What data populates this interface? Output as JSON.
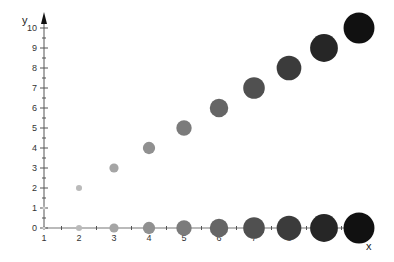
{
  "chart_data": {
    "type": "scatter",
    "title": "",
    "xlabel": "x",
    "ylabel": "y",
    "xlim": [
      1,
      10
    ],
    "ylim": [
      0,
      10
    ],
    "x_ticks": [
      "1",
      "2",
      "3",
      "4",
      "5",
      "6",
      "7",
      "8",
      "9",
      "10"
    ],
    "x_tick_labels_visible": [
      "1",
      "2",
      "3",
      "4",
      "5",
      "6",
      "7",
      "8",
      "9"
    ],
    "y_ticks": [
      "0",
      "1",
      "2",
      "3",
      "4",
      "5",
      "6",
      "7",
      "8",
      "9",
      "10"
    ],
    "grid": false,
    "legend": null,
    "series": [
      {
        "name": "diagonal",
        "points": [
          {
            "x": 1,
            "y": 1,
            "size": 1
          },
          {
            "x": 2,
            "y": 2,
            "size": 2
          },
          {
            "x": 3,
            "y": 3,
            "size": 3
          },
          {
            "x": 4,
            "y": 4,
            "size": 4
          },
          {
            "x": 5,
            "y": 5,
            "size": 5
          },
          {
            "x": 6,
            "y": 6,
            "size": 6
          },
          {
            "x": 7,
            "y": 7,
            "size": 7
          },
          {
            "x": 8,
            "y": 8,
            "size": 8
          },
          {
            "x": 9,
            "y": 9,
            "size": 9
          },
          {
            "x": 10,
            "y": 10,
            "size": 10
          }
        ]
      },
      {
        "name": "baseline",
        "points": [
          {
            "x": 1,
            "y": 0,
            "size": 1
          },
          {
            "x": 2,
            "y": 0,
            "size": 2
          },
          {
            "x": 3,
            "y": 0,
            "size": 3
          },
          {
            "x": 4,
            "y": 0,
            "size": 4
          },
          {
            "x": 5,
            "y": 0,
            "size": 5
          },
          {
            "x": 6,
            "y": 0,
            "size": 6
          },
          {
            "x": 7,
            "y": 0,
            "size": 7
          },
          {
            "x": 8,
            "y": 0,
            "size": 8
          },
          {
            "x": 9,
            "y": 0,
            "size": 9
          },
          {
            "x": 10,
            "y": 0,
            "size": 10
          }
        ]
      }
    ],
    "color_scale": {
      "low": "#cfcfcf",
      "high": "#111111"
    }
  }
}
